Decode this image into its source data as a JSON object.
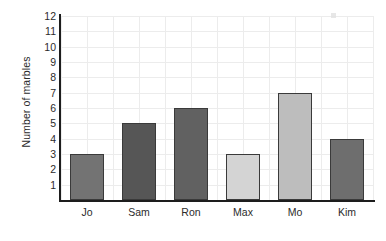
{
  "chart_data": {
    "type": "bar",
    "title": "",
    "subtitle": "",
    "xlabel": "",
    "ylabel": "Number of marbles",
    "categories": [
      "Jo",
      "Sam",
      "Ron",
      "Max",
      "Mo",
      "Kim"
    ],
    "values": [
      3,
      5,
      6,
      3,
      7,
      4
    ],
    "bar_colors": [
      "#737373",
      "#565656",
      "#616161",
      "#d4d4d4",
      "#bdbdbd",
      "#6e6e6e"
    ],
    "ylim": [
      0,
      12
    ],
    "y_ticks": [
      1,
      2,
      3,
      4,
      5,
      6,
      7,
      8,
      9,
      10,
      11,
      12
    ],
    "y_tick_labels": [
      "1",
      "2",
      "3",
      "4",
      "5",
      "6",
      "7",
      "8",
      "9",
      "10",
      "11",
      "12"
    ],
    "grid": true,
    "grid_color": "#ececec",
    "axis_color": "#1d1d1d",
    "bar_edge_color": "#3a3a3a",
    "legend": false,
    "legend_position": "none",
    "background": "#ffffff",
    "annotations": []
  }
}
